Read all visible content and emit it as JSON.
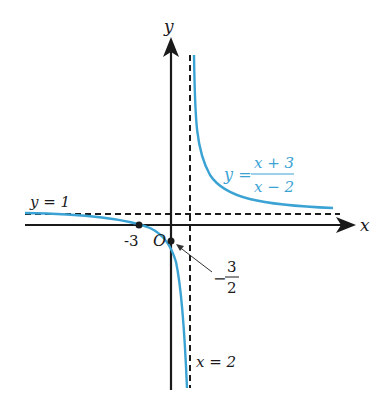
{
  "figure": {
    "function_label": {
      "lhs": "y =",
      "numerator": "x + 3",
      "denominator": "x − 2"
    },
    "axes": {
      "x_label": "x",
      "y_label": "y",
      "origin_label": "O"
    },
    "asymptotes": {
      "horizontal": "y = 1",
      "vertical": "x = 2"
    },
    "points": {
      "x_intercept": "-3",
      "y_intercept_sign": "−",
      "y_intercept_num": "3",
      "y_intercept_den": "2"
    },
    "colors": {
      "curve": "#3ba3d4",
      "axes": "#1a1a1a",
      "asymptote": "#1a1a1a"
    }
  }
}
